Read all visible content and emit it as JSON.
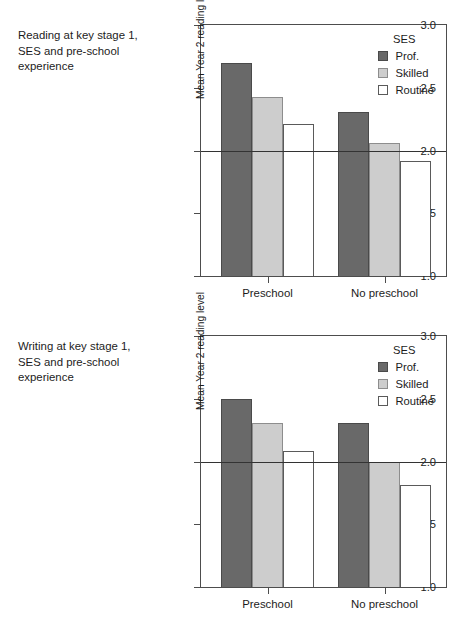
{
  "figure": {
    "panels": [
      {
        "id": "reading",
        "caption": "Reading at key stage 1,\nSES and pre-school\nexperience",
        "chart_data": {
          "type": "bar",
          "title": "Reading at key stage 1, SES and pre-school experience",
          "xlabel": "",
          "ylabel": "Mean Year 2 reading level",
          "categories": [
            "Preschool",
            "No preschool"
          ],
          "series": [
            {
              "name": "Prof.",
              "values": [
                2.7,
                2.31
              ]
            },
            {
              "name": "Skilled",
              "values": [
                2.43,
                2.06
              ]
            },
            {
              "name": "Routine",
              "values": [
                2.21,
                1.92
              ]
            }
          ],
          "ylim": [
            1.0,
            3.0
          ],
          "yticks": [
            1.0,
            1.5,
            2.0,
            2.5,
            3.0
          ],
          "ytick_labels": [
            "1.0",
            "1.5",
            "2.0",
            "2.5",
            "3.0"
          ],
          "reference_line": 2.0,
          "grid": false,
          "legend_title": "SES",
          "legend_position": "top-right"
        }
      },
      {
        "id": "writing",
        "caption": "Writing at key stage 1,\nSES and pre-school\nexperience",
        "chart_data": {
          "type": "bar",
          "title": "Writing at key stage 1, SES and pre-school experience",
          "xlabel": "",
          "ylabel": "Mean Year 2 reading level",
          "categories": [
            "Preschool",
            "No preschool"
          ],
          "series": [
            {
              "name": "Prof.",
              "values": [
                2.5,
                2.31
              ]
            },
            {
              "name": "Skilled",
              "values": [
                2.31,
                2.0
              ]
            },
            {
              "name": "Routine",
              "values": [
                2.08,
                1.81
              ]
            }
          ],
          "ylim": [
            1.0,
            3.0
          ],
          "yticks": [
            1.0,
            1.5,
            2.0,
            2.5,
            3.0
          ],
          "ytick_labels": [
            "1.0",
            "1.5",
            "2.0",
            "2.5",
            "3.0"
          ],
          "reference_line": 2.0,
          "grid": false,
          "legend_title": "SES",
          "legend_position": "top-right"
        }
      }
    ],
    "colors": {
      "prof": "#696969",
      "skilled": "#cdcdcd",
      "routine": "#ffffff",
      "axis": "#4d4d4d",
      "reference_line": "#333333",
      "text": "#1c1c1c"
    }
  }
}
